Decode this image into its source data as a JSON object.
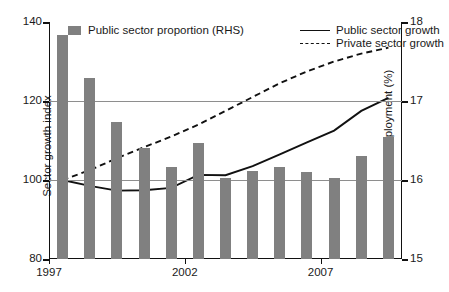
{
  "chart_data": {
    "type": "bar",
    "title": "",
    "xlabel": "",
    "ylabel": "Sector growth index",
    "y2label": "Public sector employment (%)",
    "categories": [
      "1997",
      "1998",
      "1999",
      "2000",
      "2001",
      "2002",
      "2003",
      "2004",
      "2005",
      "2006",
      "2007",
      "2008",
      "2009"
    ],
    "xtick_labels": [
      "1997",
      "2002",
      "2007"
    ],
    "xtick_categories": [
      "1997",
      "2002",
      "2007"
    ],
    "ylim": [
      80,
      140
    ],
    "ytick_labels": [
      "80",
      "100",
      "120",
      "140"
    ],
    "yticks": [
      80,
      100,
      120,
      140
    ],
    "y2lim": [
      15,
      18
    ],
    "y2tick_labels": [
      "15",
      "16",
      "17",
      "18"
    ],
    "y2ticks": [
      15,
      16,
      17,
      18
    ],
    "grid": true,
    "gridlines_at": [
      100,
      120
    ],
    "legend_position": "top-inside",
    "bar_color": "#808080",
    "line_color": "#111111",
    "series": [
      {
        "name": "Public sector proportion (RHS)",
        "type": "bar",
        "axis": "right",
        "unit": "%",
        "values": [
          17.84,
          17.29,
          16.74,
          16.41,
          16.16,
          16.47,
          16.03,
          16.12,
          16.17,
          16.1,
          16.03,
          16.31,
          16.55
        ]
      },
      {
        "name": "Public sector growth",
        "type": "line",
        "style": "solid",
        "axis": "left",
        "values": [
          100.0,
          98.5,
          97.3,
          97.4,
          98.0,
          101.3,
          101.2,
          103.5,
          106.5,
          109.5,
          112.5,
          117.5,
          120.8
        ]
      },
      {
        "name": "Private sector growth",
        "type": "line",
        "style": "dashed",
        "axis": "left",
        "values": [
          100.0,
          102.5,
          105.5,
          108.3,
          111.0,
          114.0,
          117.5,
          121.0,
          124.5,
          127.5,
          130.0,
          132.0,
          133.5
        ]
      }
    ],
    "legend": [
      {
        "label": "Public sector proportion (RHS)",
        "marker": "swatch"
      },
      {
        "label": "Public sector growth",
        "marker": "solid-line"
      },
      {
        "label": "Private sector growth",
        "marker": "dashed-line"
      }
    ]
  }
}
